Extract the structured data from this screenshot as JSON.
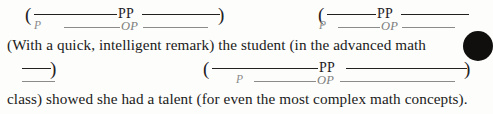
{
  "document": {
    "type": "grammar-annotation-worksheet",
    "paper_color": "#fdfdfb",
    "text_color": "#1a1a1a",
    "annotation_dark_color": "#23211f",
    "annotation_gray_color": "#8b8b8b",
    "artifact_color": "#100f0e"
  },
  "sentences": [
    {
      "id": "line1",
      "text": "(With a quick, intelligent remark) the student (in the advanced math"
    },
    {
      "id": "line2",
      "text": "class) showed she had a talent (for even the most complex math concepts)."
    }
  ],
  "annotations": {
    "row1": {
      "group_a": {
        "open_paren": "(",
        "close_paren": ")",
        "pp_label": "PP",
        "op_label": "OP",
        "p_marker": "P"
      },
      "group_b": {
        "open_paren": "(",
        "pp_label": "PP",
        "op_label": "OP",
        "p_marker": "P"
      }
    },
    "row2": {
      "group_a_continuation": {
        "close_paren": ")"
      },
      "group_c": {
        "open_paren": "(",
        "close_paren": ")",
        "pp_label": "PP",
        "op_label": "OP",
        "p_marker": "P"
      }
    }
  },
  "legend": {
    "pp_meaning": "PP",
    "op_meaning": "OP",
    "p_meaning": "P"
  }
}
